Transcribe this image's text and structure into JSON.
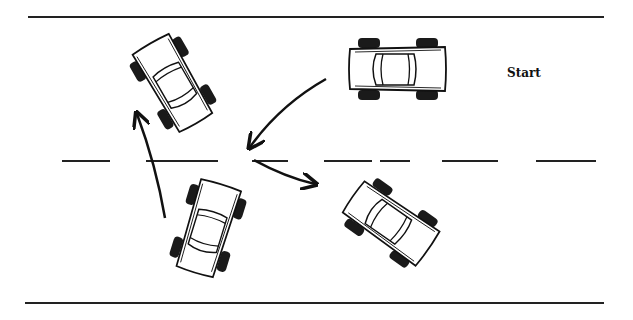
{
  "diagram": {
    "start_label": "Start",
    "colors": {
      "ink": "#111111",
      "background": "#ffffff",
      "tire": "#1a1a1a"
    },
    "road": {
      "top_edge_y": 17,
      "bottom_edge_y": 303,
      "centerline_y": 161,
      "centerline_style": "dashed"
    },
    "cars": [
      {
        "id": "car-start",
        "description": "Car at start position, facing left, upper lane"
      },
      {
        "id": "car-step1",
        "description": "Car after first turn, angled toward lower lane, rear toward top-left"
      },
      {
        "id": "car-step2",
        "description": "Car after reversing, angled in lower-left"
      },
      {
        "id": "car-final",
        "description": "Car in final position, upper-left, angled upward"
      }
    ],
    "arrows": [
      {
        "id": "arrow-1",
        "description": "From start car curving down-left toward centerline"
      },
      {
        "id": "arrow-2",
        "description": "From centerline curving down-right toward lower lane car"
      },
      {
        "id": "arrow-3",
        "description": "From lower-left curving upward toward top-left car"
      }
    ]
  }
}
